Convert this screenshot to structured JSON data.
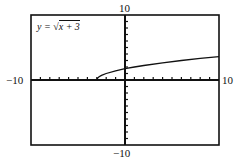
{
  "chart_data": {
    "type": "line",
    "title": "",
    "equation_label": {
      "prefix": "y = ",
      "radical": "√",
      "radicand": "x + 3"
    },
    "function": "sqrt(x+3)",
    "xlabel": "",
    "ylabel": "",
    "xlim": [
      -10,
      10
    ],
    "ylim": [
      -10,
      10
    ],
    "xscl": 1,
    "yscl": 1,
    "tick_labels": {
      "xmin": "−10",
      "xmax": "10",
      "ymin": "−10",
      "ymax": "10"
    },
    "grid": false,
    "series": [
      {
        "name": "y = √(x+3)",
        "x": [
          -3,
          -2.9,
          -2.75,
          -2.5,
          -2,
          -1,
          0,
          1,
          2,
          4,
          6,
          8,
          10
        ],
        "y": [
          0,
          0.316,
          0.5,
          0.707,
          1,
          1.414,
          1.732,
          2,
          2.236,
          2.646,
          3,
          3.317,
          3.606
        ]
      }
    ],
    "colors": {
      "axis": "#111111",
      "curve": "#111111",
      "frame": "#111111"
    }
  }
}
